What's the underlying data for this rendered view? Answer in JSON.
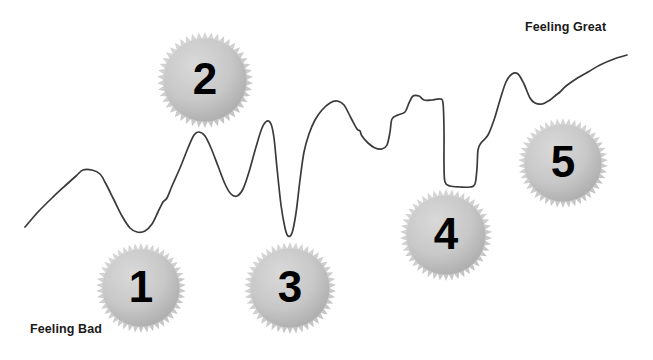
{
  "diagram": {
    "type": "mood-journey-line-with-milestone-badges",
    "background_color": "#ffffff",
    "line_color": "#3a3a3a",
    "badge_fill_light": "#d2d2d2",
    "badge_fill_dark": "#a9a9a9",
    "badge_edge_color": "#c9c9c9",
    "number_color": "#000000",
    "labels": {
      "low_end": "Feeling Bad",
      "high_end": "Feeling Great"
    },
    "badges": [
      {
        "id": "badge-1",
        "number": "1",
        "cx": 141,
        "cy": 288,
        "r": 45
      },
      {
        "id": "badge-2",
        "number": "2",
        "cx": 205,
        "cy": 80,
        "r": 48
      },
      {
        "id": "badge-3",
        "number": "3",
        "cx": 290,
        "cy": 288,
        "r": 46
      },
      {
        "id": "badge-4",
        "number": "4",
        "cx": 446,
        "cy": 235,
        "r": 46
      },
      {
        "id": "badge-5",
        "number": "5",
        "cx": 563,
        "cy": 163,
        "r": 45
      }
    ],
    "chart_data": {
      "type": "line",
      "title": "",
      "xlabel": "",
      "ylabel": "Mood",
      "grid": false,
      "legend": "none",
      "axis_annotations": [
        {
          "text": "Feeling Bad",
          "position": "bottom-left"
        },
        {
          "text": "Feeling Great",
          "position": "top-right"
        }
      ],
      "note": "y is screen pixels (smaller y = feeling better); the trace is a hand-drawn mood squiggle",
      "points": [
        [
          25,
          227
        ],
        [
          38,
          212
        ],
        [
          52,
          198
        ],
        [
          66,
          185
        ],
        [
          76,
          176
        ],
        [
          83,
          170
        ],
        [
          92,
          170
        ],
        [
          100,
          174
        ],
        [
          106,
          184
        ],
        [
          114,
          200
        ],
        [
          122,
          216
        ],
        [
          130,
          228
        ],
        [
          137,
          232
        ],
        [
          145,
          231
        ],
        [
          152,
          224
        ],
        [
          158,
          212
        ],
        [
          163,
          202
        ],
        [
          167,
          198
        ],
        [
          172,
          186
        ],
        [
          180,
          168
        ],
        [
          188,
          148
        ],
        [
          194,
          135
        ],
        [
          199,
          132
        ],
        [
          205,
          136
        ],
        [
          211,
          148
        ],
        [
          218,
          166
        ],
        [
          225,
          184
        ],
        [
          231,
          194
        ],
        [
          237,
          196
        ],
        [
          243,
          189
        ],
        [
          249,
          172
        ],
        [
          256,
          147
        ],
        [
          262,
          128
        ],
        [
          267,
          121
        ],
        [
          271,
          124
        ],
        [
          274,
          138
        ],
        [
          277,
          168
        ],
        [
          281,
          205
        ],
        [
          285,
          228
        ],
        [
          288,
          236
        ],
        [
          292,
          233
        ],
        [
          296,
          213
        ],
        [
          300,
          180
        ],
        [
          304,
          152
        ],
        [
          309,
          134
        ],
        [
          315,
          120
        ],
        [
          322,
          110
        ],
        [
          330,
          103
        ],
        [
          337,
          101
        ],
        [
          344,
          105
        ],
        [
          351,
          118
        ],
        [
          357,
          129
        ],
        [
          360,
          131
        ],
        [
          362,
          136
        ],
        [
          368,
          143
        ],
        [
          375,
          148
        ],
        [
          382,
          149
        ],
        [
          387,
          145
        ],
        [
          390,
          132
        ],
        [
          392,
          119
        ],
        [
          398,
          115
        ],
        [
          405,
          112
        ],
        [
          409,
          103
        ],
        [
          413,
          96
        ],
        [
          419,
          96
        ],
        [
          424,
          100
        ],
        [
          432,
          100
        ],
        [
          440,
          99
        ],
        [
          443,
          103
        ],
        [
          444,
          130
        ],
        [
          444,
          165
        ],
        [
          445,
          182
        ],
        [
          450,
          186
        ],
        [
          460,
          187
        ],
        [
          470,
          187
        ],
        [
          475,
          184
        ],
        [
          477,
          168
        ],
        [
          478,
          150
        ],
        [
          481,
          143
        ],
        [
          488,
          135
        ],
        [
          494,
          120
        ],
        [
          500,
          100
        ],
        [
          506,
          82
        ],
        [
          512,
          74
        ],
        [
          518,
          74
        ],
        [
          524,
          84
        ],
        [
          530,
          98
        ],
        [
          535,
          103
        ],
        [
          542,
          104
        ],
        [
          550,
          100
        ],
        [
          556,
          95
        ],
        [
          560,
          92
        ],
        [
          566,
          86
        ],
        [
          576,
          79
        ],
        [
          588,
          72
        ],
        [
          600,
          65
        ],
        [
          614,
          59
        ],
        [
          627,
          55
        ]
      ]
    }
  }
}
